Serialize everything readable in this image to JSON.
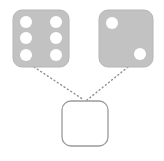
{
  "canvas": {
    "width": 164,
    "height": 161,
    "background": "#ffffff"
  },
  "colors": {
    "die_fill": "#c2c2c2",
    "die_stroke": "#b5b5b5",
    "pip_fill": "#ffffff",
    "result_fill": "#ffffff",
    "result_stroke": "#9a9a9a",
    "connector_stroke": "#8f8f8f"
  },
  "diagram": {
    "nodes": [
      {
        "id": "die-left",
        "name": "die-six",
        "label": "6",
        "pip_count": 6,
        "x": 13,
        "y": 10,
        "width": 56,
        "height": 57,
        "corner_radius": 9,
        "pips": [
          {
            "cx": 26,
            "cy": 22,
            "r": 6
          },
          {
            "cx": 56,
            "cy": 22,
            "r": 6
          },
          {
            "cx": 26,
            "cy": 38,
            "r": 6
          },
          {
            "cx": 56,
            "cy": 38,
            "r": 6
          },
          {
            "cx": 26,
            "cy": 55,
            "r": 6
          },
          {
            "cx": 56,
            "cy": 55,
            "r": 6
          }
        ]
      },
      {
        "id": "die-right",
        "name": "die-two",
        "label": "2",
        "pip_count": 2,
        "x": 99,
        "y": 10,
        "width": 54,
        "height": 57,
        "corner_radius": 9,
        "pips": [
          {
            "cx": 112,
            "cy": 23,
            "r": 6
          },
          {
            "cx": 140,
            "cy": 54,
            "r": 6
          }
        ]
      },
      {
        "id": "result-square",
        "name": "result-placeholder",
        "label": "",
        "pip_count": 0,
        "x": 62,
        "y": 101,
        "width": 46,
        "height": 45,
        "corner_radius": 9,
        "pips": []
      }
    ],
    "connectors": [
      {
        "id": "connector-left",
        "name": "connector-left-to-result",
        "from": "die-left",
        "to": "result-square",
        "x1": 34,
        "y1": 67,
        "x2": 84,
        "y2": 100,
        "style": "dotted",
        "dash": "1 3",
        "width": 1.4
      },
      {
        "id": "connector-right",
        "name": "connector-right-to-result",
        "from": "die-right",
        "to": "result-square",
        "x1": 128,
        "y1": 67,
        "x2": 87,
        "y2": 100,
        "style": "dotted",
        "dash": "1 3",
        "width": 1.4
      }
    ]
  }
}
